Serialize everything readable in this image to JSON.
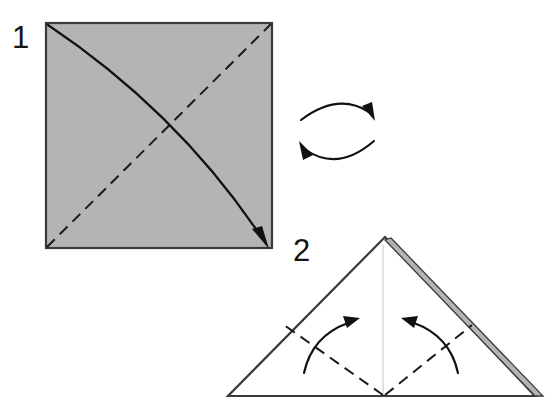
{
  "figure": {
    "background_color": "#ffffff",
    "width": 556,
    "height": 414
  },
  "palette": {
    "paper_front_gray": "#b4b4b4",
    "paper_back_white": "#ffffff",
    "edge_stroke": "#3a3a3a",
    "fold_line": "#1a1a1a",
    "arrow": "#111111",
    "faint_crease": "#e2e2e2"
  },
  "steps": [
    {
      "number": "1",
      "label_x": 12,
      "label_y": 48,
      "shape": "square",
      "shape_description": "Gray square sheet of paper seen from the colored side",
      "fill": "#b4b4b4",
      "square": {
        "left": 46,
        "top": 23,
        "right": 272,
        "bottom": 248
      },
      "fold_line": {
        "kind": "valley-fold-dashed",
        "from": "bottom-left-corner",
        "to": "top-right-corner"
      },
      "action_arrow": {
        "kind": "curved-fold-arrow",
        "from": "top-left-corner",
        "to": "bottom-right-corner",
        "description": "Fold the top-left corner down onto the bottom-right corner along the diagonal"
      }
    },
    {
      "number": "2",
      "label_x": 293,
      "label_y": 261,
      "shape": "triangle",
      "shape_description": "Folded triangle, white back side showing, with a thin gray sliver of the colored side along the right edge",
      "fill": "#ffffff",
      "triangle": {
        "apex_x": 385,
        "apex_y": 237,
        "left_x": 228,
        "base_y": 396,
        "right_x": 535
      },
      "gray_sliver": {
        "fill": "#b4b4b4",
        "description": "Thin strip of the gray side visible along the upper-right edge"
      },
      "center_crease": {
        "kind": "faint-vertical-crease",
        "description": "Faint vertical crease from apex to base center"
      },
      "fold_lines": [
        {
          "kind": "valley-fold-dashed",
          "from": "base-center",
          "to": "left-edge-midpoint"
        },
        {
          "kind": "valley-fold-dashed",
          "from": "base-center",
          "to": "right-edge-midpoint"
        }
      ],
      "action_arrows": [
        {
          "kind": "curved-fold-arrow",
          "direction": "up-and-right",
          "description": "Fold the left bottom corner up to the apex"
        },
        {
          "kind": "curved-fold-arrow",
          "direction": "up-and-left",
          "description": "Fold the right bottom corner up to the apex"
        }
      ]
    }
  ],
  "symbols": [
    {
      "name": "turn-over-symbol",
      "kind": "two-opposing-curved-arrows",
      "description": "Turn the paper over",
      "center_x": 338,
      "center_y": 128
    }
  ]
}
